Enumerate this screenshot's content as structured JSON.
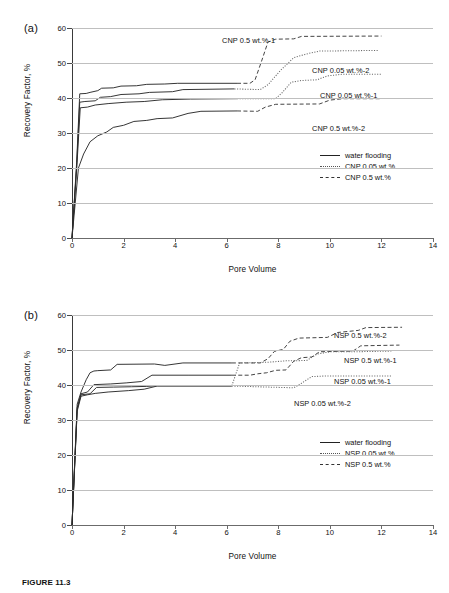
{
  "figure": {
    "caption": "FIGURE 11.3"
  },
  "panels": [
    {
      "tag": "(a)",
      "ylabel": "Recovery Factor, %",
      "xlabel": "Pore Volume",
      "yticks": [
        "0",
        "10",
        "20",
        "30",
        "40",
        "50",
        "60"
      ],
      "xticks": [
        "0",
        "2",
        "4",
        "6",
        "8",
        "10",
        "12",
        "14"
      ],
      "annotations": [
        {
          "text": "CNP 0.5 wt.%-1",
          "x": 150,
          "y": 8
        },
        {
          "text": "CNP 0.05 wt.%-2",
          "x": 240,
          "y": 38
        },
        {
          "text": "CNP 0.05 wt.%-1",
          "x": 248,
          "y": 63
        },
        {
          "text": "CNP 0.5 wt.%-2",
          "x": 240,
          "y": 96
        }
      ],
      "legend": [
        {
          "label": "water flooding",
          "style": "solid"
        },
        {
          "label": "CNP 0.05 wt.%",
          "style": "dotted"
        },
        {
          "label": "CNP 0.5 wt.%",
          "style": "dashed"
        }
      ]
    },
    {
      "tag": "(b)",
      "ylabel": "Recovery Factor, %",
      "xlabel": "Pore Volume",
      "yticks": [
        "0",
        "10",
        "20",
        "30",
        "40",
        "50",
        "60"
      ],
      "xticks": [
        "0",
        "2",
        "4",
        "6",
        "8",
        "10",
        "12",
        "14"
      ],
      "annotations": [
        {
          "text": "NSP 0.5 wt.%-2",
          "x": 262,
          "y": 16
        },
        {
          "text": "NSP 0.5 wt.%-1",
          "x": 272,
          "y": 41
        },
        {
          "text": "NSP 0.05 wt.%-1",
          "x": 262,
          "y": 62
        },
        {
          "text": "NSP 0.05 wt.%-2",
          "x": 222,
          "y": 84
        }
      ],
      "legend": [
        {
          "label": "water flooding",
          "style": "solid"
        },
        {
          "label": "NSP 0.05 wt.%",
          "style": "dotted"
        },
        {
          "label": "NSP 0.5 wt.%",
          "style": "dashed"
        }
      ]
    }
  ],
  "chart_data": [
    {
      "type": "line",
      "title": "(a)",
      "xlabel": "Pore Volume",
      "ylabel": "Recovery Factor, %",
      "xlim": [
        0,
        14
      ],
      "ylim": [
        0,
        60
      ],
      "grid": "horizontal",
      "legend_position": "inside-right",
      "series": [
        {
          "name": "CNP 0.5 wt.%-1",
          "legend_group": "CNP 0.5 wt.%",
          "solid_part": [
            [
              0,
              0
            ],
            [
              0.18,
              21.5
            ],
            [
              0.3,
              41.2
            ],
            [
              0.55,
              41.3
            ],
            [
              0.7,
              41.6
            ],
            [
              1.0,
              42.1
            ],
            [
              1.15,
              42.8
            ],
            [
              1.6,
              42.9
            ],
            [
              1.9,
              43.4
            ],
            [
              2.5,
              43.5
            ],
            [
              2.9,
              43.9
            ],
            [
              3.6,
              44.0
            ],
            [
              4.1,
              44.2
            ],
            [
              6.4,
              44.2
            ]
          ],
          "dashed_part": [
            [
              6.4,
              44.2
            ],
            [
              6.9,
              44.2
            ],
            [
              7.1,
              45.2
            ],
            [
              7.35,
              50.5
            ],
            [
              7.6,
              56.0
            ],
            [
              7.9,
              56.8
            ],
            [
              8.6,
              56.9
            ],
            [
              8.9,
              57.6
            ],
            [
              12.0,
              57.7
            ]
          ],
          "final_value": 57.7
        },
        {
          "name": "CNP 0.05 wt.%-2",
          "legend_group": "CNP 0.05 wt.%",
          "solid_part": [
            [
              0,
              0
            ],
            [
              0.18,
              20.5
            ],
            [
              0.3,
              38.8
            ],
            [
              0.5,
              39.0
            ],
            [
              0.9,
              39.2
            ],
            [
              1.1,
              40.2
            ],
            [
              1.5,
              40.4
            ],
            [
              1.9,
              41.0
            ],
            [
              2.6,
              41.2
            ],
            [
              3.0,
              41.6
            ],
            [
              3.9,
              41.8
            ],
            [
              4.3,
              42.4
            ],
            [
              6.3,
              42.6
            ]
          ],
          "dotted_part": [
            [
              6.3,
              42.6
            ],
            [
              7.3,
              42.4
            ],
            [
              7.6,
              43.8
            ],
            [
              8.1,
              48.0
            ],
            [
              8.6,
              51.5
            ],
            [
              9.1,
              52.6
            ],
            [
              9.6,
              53.4
            ],
            [
              11.9,
              53.6
            ]
          ],
          "final_value": 53.6
        },
        {
          "name": "CNP 0.05 wt.%-1",
          "legend_group": "CNP 0.05 wt.%",
          "solid_part": [
            [
              0,
              0
            ],
            [
              0.2,
              22.0
            ],
            [
              0.32,
              37.2
            ],
            [
              0.6,
              37.4
            ],
            [
              0.9,
              38.0
            ],
            [
              1.4,
              38.4
            ],
            [
              2.1,
              38.8
            ],
            [
              2.8,
              39.0
            ],
            [
              3.5,
              39.5
            ],
            [
              4.6,
              39.7
            ],
            [
              6.4,
              39.8
            ]
          ],
          "dotted_part": [
            [
              6.4,
              39.8
            ],
            [
              7.9,
              39.8
            ],
            [
              8.15,
              41.5
            ],
            [
              8.5,
              44.5
            ],
            [
              8.9,
              45.0
            ],
            [
              9.5,
              45.2
            ],
            [
              9.9,
              46.3
            ],
            [
              10.5,
              46.8
            ],
            [
              12.0,
              46.8
            ]
          ],
          "final_value": 46.8
        },
        {
          "name": "CNP 0.5 wt.%-2",
          "legend_group": "CNP 0.5 wt.%",
          "solid_part": [
            [
              0,
              0
            ],
            [
              0.25,
              20.0
            ],
            [
              0.45,
              24.0
            ],
            [
              0.7,
              27.5
            ],
            [
              1.0,
              29.2
            ],
            [
              1.35,
              30.3
            ],
            [
              1.6,
              31.6
            ],
            [
              2.0,
              32.2
            ],
            [
              2.4,
              33.3
            ],
            [
              2.9,
              33.6
            ],
            [
              3.3,
              34.1
            ],
            [
              3.9,
              34.3
            ],
            [
              4.5,
              35.6
            ],
            [
              5.0,
              36.2
            ],
            [
              6.4,
              36.3
            ]
          ],
          "dashed_part": [
            [
              6.4,
              36.3
            ],
            [
              7.2,
              36.2
            ],
            [
              7.5,
              37.4
            ],
            [
              7.9,
              38.2
            ],
            [
              9.6,
              38.3
            ],
            [
              10.0,
              39.4
            ],
            [
              10.5,
              39.8
            ],
            [
              12.0,
              39.8
            ]
          ],
          "final_value": 39.8
        }
      ]
    },
    {
      "type": "line",
      "title": "(b)",
      "xlabel": "Pore Volume",
      "ylabel": "Recovery Factor, %",
      "xlim": [
        0,
        14
      ],
      "ylim": [
        0,
        60
      ],
      "grid": "horizontal",
      "legend_position": "inside-right",
      "series": [
        {
          "name": "NSP 0.5 wt.%-2",
          "legend_group": "NSP 0.5 wt.%",
          "solid_part": [
            [
              0,
              0
            ],
            [
              0.2,
              34.5
            ],
            [
              0.35,
              38.0
            ],
            [
              0.55,
              41.5
            ],
            [
              0.7,
              43.5
            ],
            [
              0.85,
              44.0
            ],
            [
              1.0,
              44.1
            ],
            [
              1.5,
              44.3
            ],
            [
              1.75,
              45.9
            ],
            [
              3.2,
              46.0
            ],
            [
              3.6,
              45.6
            ],
            [
              4.3,
              46.3
            ],
            [
              6.2,
              46.3
            ]
          ],
          "dashed_part": [
            [
              6.2,
              46.3
            ],
            [
              7.3,
              46.3
            ],
            [
              7.6,
              47.5
            ],
            [
              7.85,
              49.6
            ],
            [
              8.2,
              50.2
            ],
            [
              8.45,
              52.5
            ],
            [
              8.8,
              53.4
            ],
            [
              9.9,
              53.6
            ],
            [
              10.3,
              55.0
            ],
            [
              11.1,
              55.6
            ],
            [
              11.4,
              56.4
            ],
            [
              12.8,
              56.5
            ]
          ],
          "final_value": 56.5
        },
        {
          "name": "NSP 0.5 wt.%-1",
          "legend_group": "NSP 0.5 wt.%",
          "solid_part": [
            [
              0,
              0
            ],
            [
              0.2,
              33.5
            ],
            [
              0.35,
              37.5
            ],
            [
              0.6,
              38.0
            ],
            [
              0.85,
              40.1
            ],
            [
              1.5,
              40.3
            ],
            [
              2.1,
              40.6
            ],
            [
              2.7,
              41.0
            ],
            [
              3.1,
              42.8
            ],
            [
              4.5,
              42.8
            ],
            [
              6.2,
              42.8
            ]
          ],
          "dashed_part": [
            [
              6.2,
              42.8
            ],
            [
              6.9,
              42.8
            ],
            [
              7.2,
              43.2
            ],
            [
              7.55,
              43.5
            ],
            [
              7.9,
              44.2
            ],
            [
              8.3,
              44.3
            ],
            [
              8.6,
              46.8
            ],
            [
              8.9,
              47.8
            ],
            [
              9.3,
              48.0
            ],
            [
              9.6,
              49.5
            ],
            [
              10.9,
              49.7
            ],
            [
              11.2,
              51.2
            ],
            [
              12.7,
              51.4
            ]
          ],
          "final_value": 51.4
        },
        {
          "name": "NSP 0.05 wt.%-1",
          "legend_group": "NSP 0.05 wt.%",
          "solid_part": [
            [
              0,
              0
            ],
            [
              0.2,
              33.0
            ],
            [
              0.35,
              37.2
            ],
            [
              0.7,
              37.5
            ],
            [
              0.95,
              39.3
            ],
            [
              1.6,
              39.4
            ],
            [
              2.3,
              39.5
            ],
            [
              2.9,
              39.6
            ],
            [
              3.3,
              39.8
            ],
            [
              6.2,
              39.8
            ]
          ],
          "dotted_part": [
            [
              6.2,
              39.8
            ],
            [
              6.5,
              46.3
            ],
            [
              7.1,
              46.4
            ],
            [
              7.6,
              46.5
            ],
            [
              8.3,
              46.9
            ],
            [
              9.1,
              47.0
            ],
            [
              9.5,
              48.8
            ],
            [
              10.0,
              49.5
            ],
            [
              11.0,
              49.5
            ],
            [
              12.4,
              49.7
            ]
          ],
          "final_value": 49.7
        },
        {
          "name": "NSP 0.05 wt.%-2",
          "legend_group": "NSP 0.05 wt.%",
          "solid_part": [
            [
              0,
              0
            ],
            [
              0.2,
              32.5
            ],
            [
              0.35,
              36.8
            ],
            [
              0.6,
              37.2
            ],
            [
              0.9,
              37.6
            ],
            [
              1.4,
              38.0
            ],
            [
              2.2,
              38.4
            ],
            [
              2.8,
              38.8
            ],
            [
              3.3,
              39.7
            ],
            [
              6.2,
              39.7
            ]
          ],
          "dotted_part": [
            [
              6.2,
              39.7
            ],
            [
              8.6,
              39.2
            ],
            [
              8.9,
              40.5
            ],
            [
              9.3,
              42.4
            ],
            [
              9.9,
              42.6
            ],
            [
              12.4,
              42.6
            ]
          ],
          "final_value": 42.6
        }
      ]
    }
  ]
}
